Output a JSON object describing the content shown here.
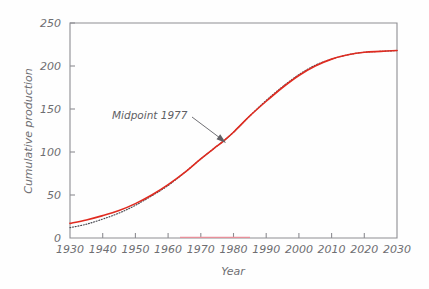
{
  "chart_data": {
    "type": "line",
    "title": "",
    "xlabel": "Year",
    "ylabel": "Cumulative production",
    "xlim": [
      1930,
      2030
    ],
    "ylim": [
      0,
      250
    ],
    "grid": false,
    "legend": "none",
    "xticks": [
      1930,
      1940,
      1950,
      1960,
      1970,
      1980,
      1990,
      2000,
      2010,
      2020,
      2030
    ],
    "xtick_labels": [
      "1930",
      "1940",
      "1950",
      "1960",
      "1970",
      "1980",
      "1990",
      "2000",
      "2010",
      "2020",
      "2030"
    ],
    "yticks": [
      0,
      50,
      100,
      150,
      200,
      250
    ],
    "ytick_labels": [
      "0",
      "50",
      "100",
      "150",
      "200",
      "250"
    ],
    "annotations": [
      {
        "text": "Midpoint 1977",
        "x": 1977,
        "y": 113,
        "label_x": 1948,
        "label_y": 150
      }
    ],
    "series": [
      {
        "name": "cumulative-production-fit",
        "style": "solid",
        "color": "#e02b20",
        "x": [
          1930,
          1935,
          1940,
          1945,
          1950,
          1955,
          1960,
          1965,
          1970,
          1975,
          1977,
          1980,
          1985,
          1990,
          1995,
          2000,
          2005,
          2010,
          2015,
          2020,
          2025,
          2030
        ],
        "y": [
          17,
          21,
          26,
          32,
          40,
          50,
          62,
          76,
          92,
          107,
          113,
          123,
          142,
          159,
          175,
          189,
          200,
          208,
          213,
          216,
          217,
          218
        ]
      },
      {
        "name": "cumulative-production-data",
        "style": "dotted",
        "color": "#4a4a52",
        "x": [
          1930,
          1935,
          1940,
          1945,
          1950,
          1955,
          1960,
          1965,
          1970,
          1975,
          1977,
          1980,
          1985,
          1990,
          1995,
          2000,
          2005,
          2010,
          2015,
          2020,
          2025,
          2030
        ],
        "y": [
          12,
          16,
          22,
          29,
          38,
          49,
          61,
          76,
          92,
          107,
          113,
          123,
          142,
          160,
          176,
          190,
          201,
          208,
          213,
          216,
          217,
          218
        ]
      }
    ]
  },
  "axes": {
    "x_axis_title": "Year",
    "y_axis_title": "Cumulative production"
  }
}
